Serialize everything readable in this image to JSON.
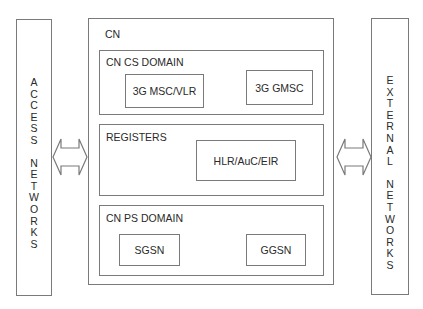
{
  "diagram": {
    "access_networks": {
      "label": "ACCESS NETWORKS",
      "words": [
        "ACCESS",
        "NETWORKS"
      ]
    },
    "external_networks": {
      "label": "EXTERNAL NETWORKS",
      "words": [
        "EXTERNAL",
        "NETWORKS"
      ]
    },
    "core_network": {
      "label": "CN",
      "cs_domain": {
        "label": "CN CS DOMAIN",
        "nodes": [
          {
            "label": "3G MSC/VLR"
          },
          {
            "label": "3G GMSC"
          }
        ]
      },
      "registers": {
        "label": "REGISTERS",
        "nodes": [
          {
            "label": "HLR/AuC/EIR"
          }
        ]
      },
      "ps_domain": {
        "label": "CN PS DOMAIN",
        "nodes": [
          {
            "label": "SGSN"
          },
          {
            "label": "GGSN"
          }
        ]
      }
    },
    "connectors": [
      {
        "from": "ACCESS NETWORKS",
        "to": "CN",
        "type": "bidirectional-arrow"
      },
      {
        "from": "CN",
        "to": "EXTERNAL NETWORKS",
        "type": "bidirectional-arrow"
      }
    ],
    "colors": {
      "line": "#7a7a7a",
      "text": "#2a2a2a",
      "background": "#ffffff"
    }
  }
}
